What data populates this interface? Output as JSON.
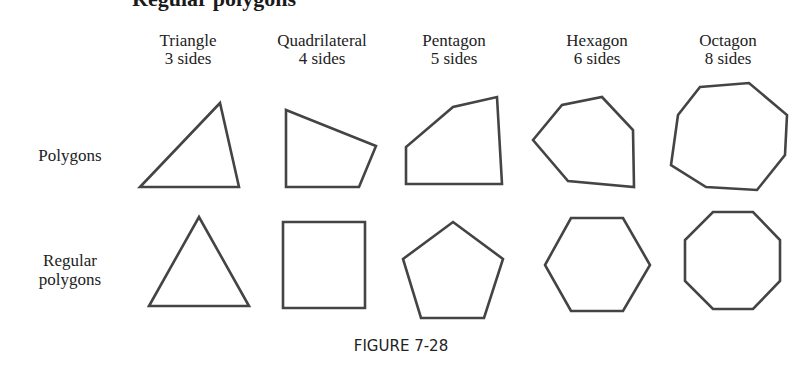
{
  "heading": {
    "text": "Regular polygons"
  },
  "columns": [
    {
      "name": "Triangle",
      "sides": "3 sides",
      "center_x": 188
    },
    {
      "name": "Quadrilateral",
      "sides": "4 sides",
      "center_x": 322
    },
    {
      "name": "Pentagon",
      "sides": "5 sides",
      "center_x": 454
    },
    {
      "name": "Hexagon",
      "sides": "6 sides",
      "center_x": 597
    },
    {
      "name": "Octagon",
      "sides": "8 sides",
      "center_x": 728
    }
  ],
  "rows": [
    {
      "label": "Polygons"
    },
    {
      "label_line1": "Regular",
      "label_line2": "polygons"
    }
  ],
  "shapes": {
    "stroke_color": "#444444",
    "polygons": [
      "140,187 220,103 239,187",
      "286,110 376,146 359,187 286,187",
      "406,184 406,147 453,107 497,97 502,184",
      "533,140 562,105 602,97 633,130 634,187 568,181",
      "700,87 749,83 787,115 785,155 757,190 706,187 671,165 678,115"
    ],
    "regular": [
      "149,306 199,217 249,306",
      "283,222 365,222 365,308 283,308",
      "453,222 503,259 484,318 421,318 403,259",
      "571,218 623,218 650,265 623,311 571,311 545,265",
      "713,212 753,212 780,240 780,281 753,309 713,309 685,281 685,240"
    ]
  },
  "caption": "FIGURE 7-28"
}
